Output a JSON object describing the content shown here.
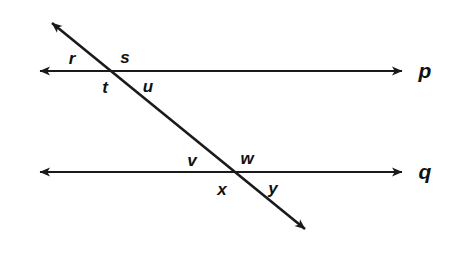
{
  "figure": {
    "kind": "geometry-diagram",
    "stroke_color": "#1a1a1a",
    "background_color": "#ffffff",
    "width": 460,
    "height": 261
  },
  "lines": [
    {
      "id": "line-p",
      "label": "p",
      "orientation": "horizontal",
      "label_x": 425,
      "label_y": 70,
      "x1": 30,
      "y1": 71,
      "x2": 412,
      "y2": 71,
      "arrow_start": true,
      "arrow_end": true
    },
    {
      "id": "line-q",
      "label": "q",
      "orientation": "horizontal",
      "label_x": 425,
      "label_y": 171,
      "x1": 30,
      "y1": 172,
      "x2": 412,
      "y2": 172,
      "arrow_start": true,
      "arrow_end": true
    },
    {
      "id": "transversal",
      "label": "",
      "orientation": "diagonal",
      "label_x": 0,
      "label_y": 0,
      "x1": 42,
      "y1": 15,
      "x2": 315,
      "y2": 237,
      "arrow_start": true,
      "arrow_end": true
    }
  ],
  "intersections": [
    {
      "id": "upper-intersection",
      "on_line": "p",
      "x": 118,
      "y": 71
    },
    {
      "id": "lower-intersection",
      "on_line": "q",
      "x": 233,
      "y": 172
    }
  ],
  "angle_labels": [
    {
      "id": "angle-r",
      "text": "r",
      "x": 72,
      "y": 58,
      "intersection": "upper-intersection",
      "position": "upper-left"
    },
    {
      "id": "angle-s",
      "text": "s",
      "x": 125,
      "y": 57,
      "intersection": "upper-intersection",
      "position": "upper-right"
    },
    {
      "id": "angle-t",
      "text": "t",
      "x": 105,
      "y": 87,
      "intersection": "upper-intersection",
      "position": "lower-left"
    },
    {
      "id": "angle-u",
      "text": "u",
      "x": 148,
      "y": 86,
      "intersection": "upper-intersection",
      "position": "lower-right"
    },
    {
      "id": "angle-v",
      "text": "v",
      "x": 192,
      "y": 160,
      "intersection": "lower-intersection",
      "position": "upper-left"
    },
    {
      "id": "angle-w",
      "text": "w",
      "x": 247,
      "y": 158,
      "intersection": "lower-intersection",
      "position": "upper-right"
    },
    {
      "id": "angle-x",
      "text": "x",
      "x": 222,
      "y": 189,
      "intersection": "lower-intersection",
      "position": "lower-left"
    },
    {
      "id": "angle-y",
      "text": "y",
      "x": 273,
      "y": 188,
      "intersection": "lower-intersection",
      "position": "lower-right"
    }
  ]
}
